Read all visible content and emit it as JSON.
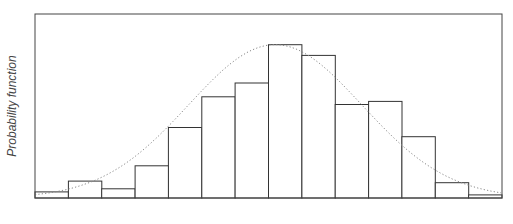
{
  "chart_data": {
    "type": "bar",
    "subtype": "histogram_with_density_curve",
    "title": "",
    "xlabel": "",
    "ylabel": "Probability function",
    "grid": false,
    "legend": null,
    "bins": 14,
    "values": [
      0.04,
      0.11,
      0.06,
      0.21,
      0.46,
      0.66,
      0.75,
      1.0,
      0.93,
      0.61,
      0.63,
      0.4,
      0.1,
      0.02
    ],
    "ylim": [
      0,
      1.2
    ],
    "density_curve": {
      "style": "dotted",
      "shape": "normal",
      "peak_bin_position": 7.2,
      "peak_value": 1.0,
      "sigma_bins": 2.6
    },
    "colors": {
      "bar_fill": "#ffffff",
      "bar_edge": "#333333",
      "frame": "#444444",
      "curve": "#888888"
    }
  },
  "plot_area": {
    "x0": 35,
    "y0": 14,
    "x1": 502,
    "y1": 198
  }
}
